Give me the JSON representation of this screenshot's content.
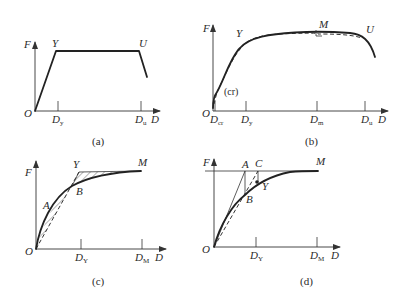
{
  "figure": {
    "panels": [
      {
        "id": "a",
        "caption": "(a)",
        "axis_y": "F",
        "axis_x": "D",
        "origin": "O",
        "points": {
          "yield": "Y",
          "ultimate": "U"
        },
        "ticks": [
          {
            "main": "D",
            "sub": "y"
          },
          {
            "main": "D",
            "sub": "u"
          }
        ],
        "description": "Idealized trilinear: linear rise O→Y, plateau Y→U, descending branch"
      },
      {
        "id": "b",
        "caption": "(b)",
        "axis_y": "F",
        "axis_x": "D",
        "origin": "O",
        "points": {
          "crack": "(cr)",
          "yield": "Y",
          "max": "M",
          "ultimate": "U"
        },
        "ticks": [
          {
            "main": "D",
            "sub": "cr"
          },
          {
            "main": "D",
            "sub": "y"
          },
          {
            "main": "D",
            "sub": "m"
          },
          {
            "main": "D",
            "sub": "u"
          }
        ],
        "description": "Actual skeleton curve (solid) with idealized curve (dashed)"
      },
      {
        "id": "c",
        "caption": "(c)",
        "axis_y": "F",
        "axis_x": "D",
        "origin": "O",
        "points": {
          "a": "A",
          "b": "B",
          "yield": "Y",
          "max": "M"
        },
        "ticks": [
          {
            "main": "D",
            "sub": "Y"
          },
          {
            "main": "D",
            "sub": "M"
          }
        ],
        "description": "Equal-energy method: hatched areas between curve and bilinear O-Y-M"
      },
      {
        "id": "d",
        "caption": "(d)",
        "axis_y": "F",
        "axis_x": "D",
        "origin": "O",
        "points": {
          "a": "A",
          "b": "B",
          "c": "C",
          "yield": "Y",
          "max": "M"
        },
        "ticks": [
          {
            "main": "D",
            "sub": "Y"
          },
          {
            "main": "D",
            "sub": "M"
          }
        ],
        "description": "Geometric construction for yield point using tangent line O-A and secant through B"
      }
    ]
  }
}
